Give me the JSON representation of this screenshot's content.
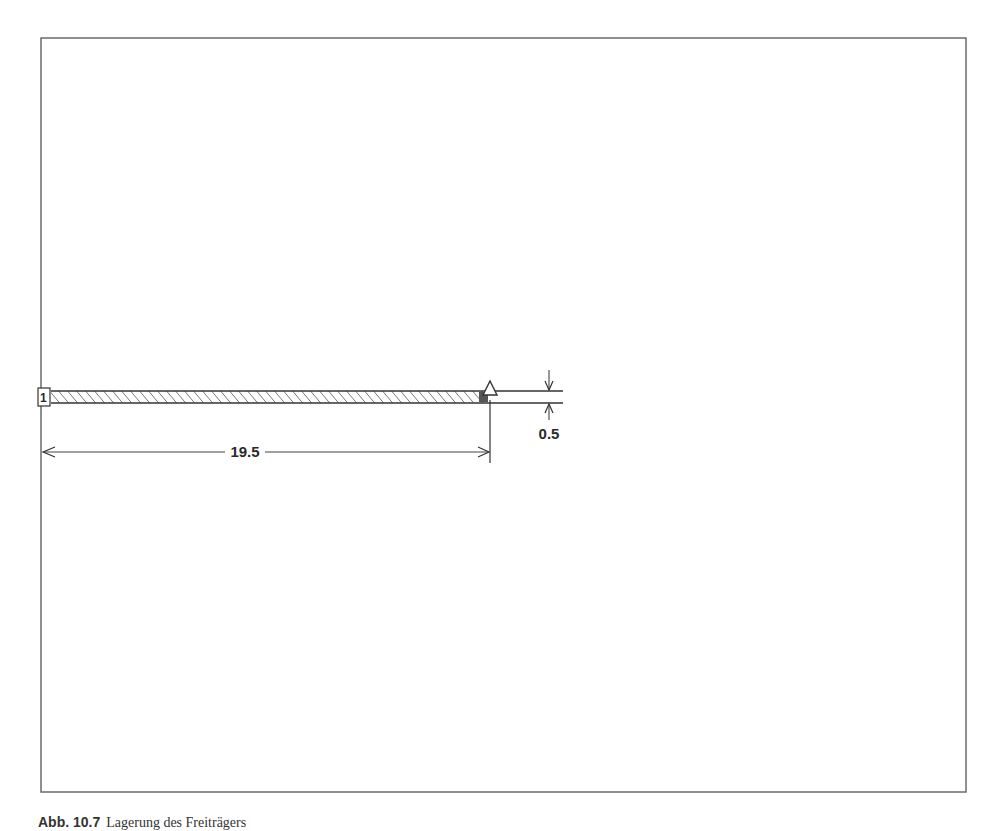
{
  "diagram": {
    "type": "structural-beam-drawing",
    "frame": {
      "x": 41,
      "y": 38,
      "width": 925,
      "height": 754,
      "stroke": "#6b6b6b"
    },
    "beam": {
      "node_label": "1",
      "length_label": "19.5",
      "thickness_label": "0.5",
      "hatch_color": "#555555",
      "line_color": "#333333"
    },
    "support": {
      "kind": "pinned-triangle"
    }
  },
  "caption": {
    "number": "Abb. 10.7",
    "text": "Lagerung des Freiträgers"
  }
}
